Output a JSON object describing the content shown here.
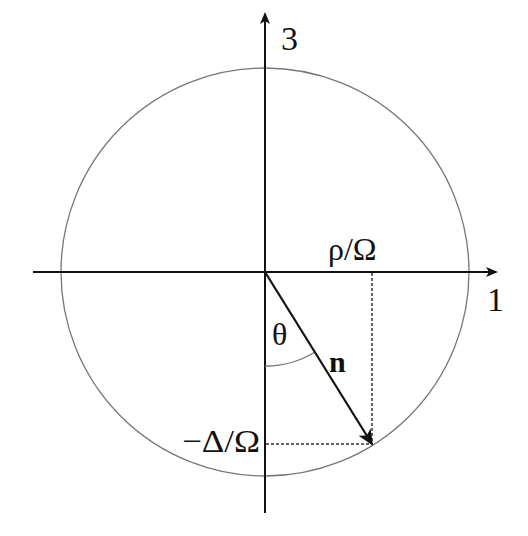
{
  "diagram": {
    "type": "bloch-vector-projection",
    "axes": {
      "vertical_label": "3",
      "horizontal_label": "1"
    },
    "labels": {
      "horizontal_projection": "ρ/Ω",
      "vertical_projection": "−Δ/Ω",
      "angle": "θ",
      "vector": "n"
    },
    "colors": {
      "axes": "#111111",
      "circle": "#777777",
      "dotted": "#333333"
    }
  }
}
